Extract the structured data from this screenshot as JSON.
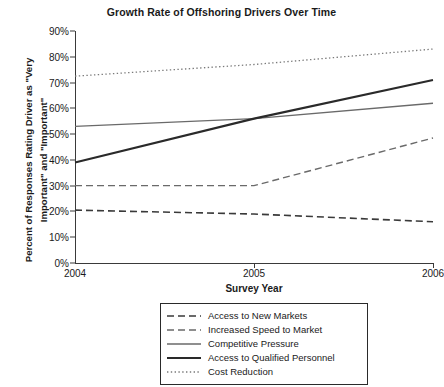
{
  "chart_data": {
    "type": "line",
    "title": "Growth Rate of Offshoring Drivers Over Time",
    "xlabel": "Survey Year",
    "ylabel": "Percent of Responses Rating Driver as \"Very Important\" and \"Important\"",
    "ylabel_line1": "Percent of Responses Rating Driver as \"Very",
    "ylabel_line2": "Important\" and \"Important\"",
    "categories": [
      "2004",
      "2005",
      "2006"
    ],
    "x": [
      2004,
      2005,
      2006
    ],
    "xlim": [
      2004,
      2006
    ],
    "ylim": [
      0,
      90
    ],
    "ytick_labels": [
      "0%",
      "10%",
      "20%",
      "30%",
      "40%",
      "50%",
      "60%",
      "70%",
      "80%",
      "90%"
    ],
    "ytick_values": [
      0,
      10,
      20,
      30,
      40,
      50,
      60,
      70,
      80,
      90
    ],
    "grid": false,
    "legend_position": "below",
    "series": [
      {
        "name": "Access to New Markets",
        "values": [
          20.5,
          19,
          16
        ],
        "style": "dashed",
        "color": "#3a3a3a",
        "width": 1.6
      },
      {
        "name": "Increased Speed to Market",
        "values": [
          30,
          30,
          48.5
        ],
        "style": "dashed",
        "color": "#6a6a6a",
        "width": 1.4
      },
      {
        "name": "Competitive Pressure",
        "values": [
          53,
          56,
          62
        ],
        "style": "solid",
        "color": "#6a6a6a",
        "width": 1.4
      },
      {
        "name": "Access to Qualified Personnel",
        "values": [
          39,
          56,
          71
        ],
        "style": "solid",
        "color": "#2a2a2a",
        "width": 2.1
      },
      {
        "name": "Cost Reduction",
        "values": [
          72.5,
          77,
          83
        ],
        "style": "dotted",
        "color": "#7a7a7a",
        "width": 1.3
      }
    ]
  }
}
